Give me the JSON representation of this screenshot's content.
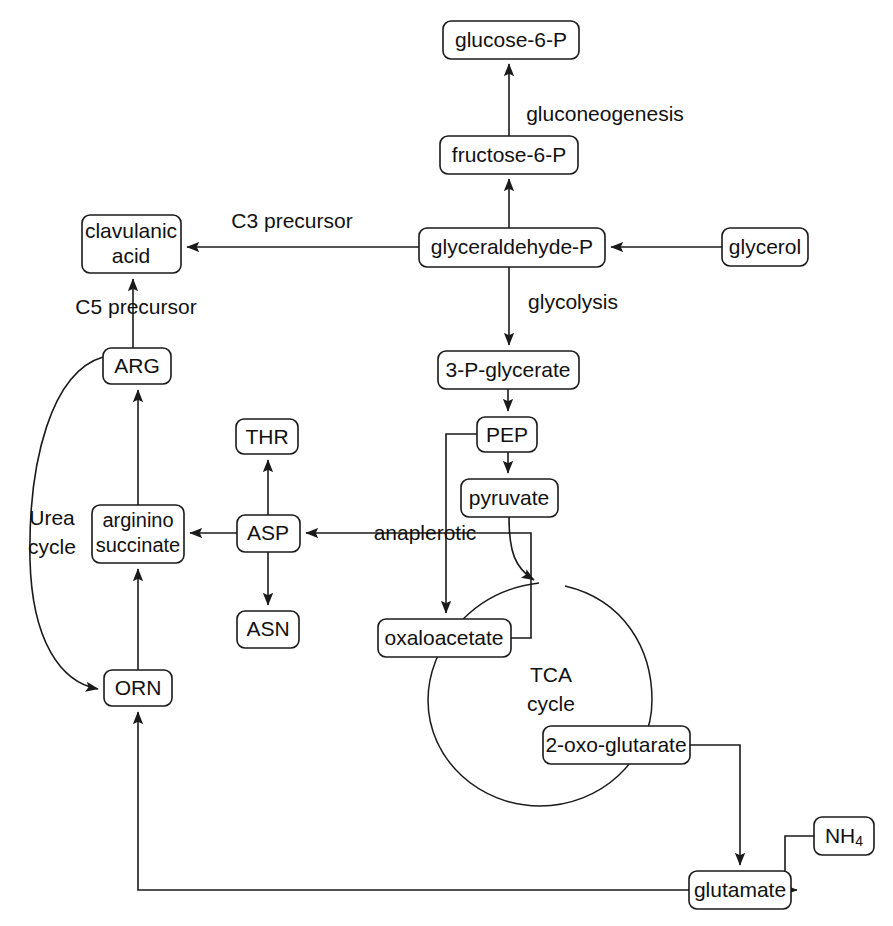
{
  "diagram": {
    "type": "pathway-flowchart",
    "canvas": {
      "width": 893,
      "height": 926
    },
    "background_color": "#ffffff",
    "line_color": "#1a1a1a",
    "text_color": "#111111"
  },
  "nodes": [
    {
      "id": "glucose6p",
      "label": "glucose-6-P",
      "lines": [
        "glucose-6-P"
      ],
      "x": 443,
      "y": 21,
      "w": 136,
      "h": 38
    },
    {
      "id": "fructose6p",
      "label": "fructose-6-P",
      "lines": [
        "fructose-6-P"
      ],
      "x": 440,
      "y": 136,
      "w": 138,
      "h": 38
    },
    {
      "id": "glyceraldehydep",
      "label": "glyceraldehyde-P",
      "lines": [
        "glyceraldehyde-P"
      ],
      "x": 419,
      "y": 228,
      "w": 186,
      "h": 39
    },
    {
      "id": "glycerol",
      "label": "glycerol",
      "lines": [
        "glycerol"
      ],
      "x": 722,
      "y": 228,
      "w": 86,
      "h": 38
    },
    {
      "id": "clavulanicacid",
      "label": "clavulanic acid",
      "lines": [
        "clavulanic",
        "acid"
      ],
      "x": 82,
      "y": 215,
      "w": 99,
      "h": 58
    },
    {
      "id": "glycerate3p",
      "label": "3-P-glycerate",
      "lines": [
        "3-P-glycerate"
      ],
      "x": 438,
      "y": 351,
      "w": 141,
      "h": 38
    },
    {
      "id": "pep",
      "label": "PEP",
      "lines": [
        "PEP"
      ],
      "x": 477,
      "y": 417,
      "w": 60,
      "h": 35
    },
    {
      "id": "pyruvate",
      "label": "pyruvate",
      "lines": [
        "pyruvate"
      ],
      "x": 461,
      "y": 479,
      "w": 97,
      "h": 38
    },
    {
      "id": "arg",
      "label": "ARG",
      "lines": [
        "ARG"
      ],
      "x": 103,
      "y": 348,
      "w": 68,
      "h": 36
    },
    {
      "id": "argininosuccinate",
      "label": "arginino succinate",
      "lines": [
        "arginino",
        "succinate"
      ],
      "x": 92,
      "y": 505,
      "w": 92,
      "h": 58
    },
    {
      "id": "orn",
      "label": "ORN",
      "lines": [
        "ORN"
      ],
      "x": 104,
      "y": 670,
      "w": 68,
      "h": 36
    },
    {
      "id": "thr",
      "label": "THR",
      "lines": [
        "THR"
      ],
      "x": 236,
      "y": 419,
      "w": 62,
      "h": 35
    },
    {
      "id": "asp",
      "label": "ASP",
      "lines": [
        "ASP"
      ],
      "x": 237,
      "y": 515,
      "w": 63,
      "h": 37
    },
    {
      "id": "asn",
      "label": "ASN",
      "lines": [
        "ASN"
      ],
      "x": 237,
      "y": 611,
      "w": 62,
      "h": 37
    },
    {
      "id": "oxaloacetate",
      "label": "oxaloacetate",
      "lines": [
        "oxaloacetate"
      ],
      "x": 378,
      "y": 619,
      "w": 133,
      "h": 38
    },
    {
      "id": "oxoglutarate",
      "label": "2-oxo-glutarate",
      "lines": [
        "2-oxo-glutarate"
      ],
      "x": 543,
      "y": 726,
      "w": 147,
      "h": 38
    },
    {
      "id": "glutamate",
      "label": "glutamate",
      "lines": [
        "glutamate"
      ],
      "x": 689,
      "y": 871,
      "w": 102,
      "h": 38
    },
    {
      "id": "nh4",
      "label": "NH4",
      "lines": [
        "NH4"
      ],
      "x": 814,
      "y": 817,
      "w": 60,
      "h": 38,
      "subscript": "4",
      "base": "NH"
    }
  ],
  "edge_labels": [
    {
      "id": "gluconeogenesis",
      "text": "gluconeogenesis",
      "x": 605,
      "y": 115
    },
    {
      "id": "c3precursor",
      "text": "C3 precursor",
      "x": 292,
      "y": 222
    },
    {
      "id": "glycolysis",
      "text": "glycolysis",
      "x": 573,
      "y": 303
    },
    {
      "id": "c5precursor",
      "text": "C5 precursor",
      "x": 136,
      "y": 308
    },
    {
      "id": "anaplerotic",
      "text": "anaplerotic",
      "x": 425,
      "y": 534
    },
    {
      "id": "ureacycle_1",
      "text": "Urea",
      "x": 52,
      "y": 519
    },
    {
      "id": "ureacycle_2",
      "text": "cycle",
      "x": 52,
      "y": 548
    },
    {
      "id": "tcacycle_1",
      "text": "TCA",
      "x": 551,
      "y": 676
    },
    {
      "id": "tcacycle_2",
      "text": "cycle",
      "x": 551,
      "y": 705
    }
  ],
  "edges": [
    {
      "id": "fructose6p-to-glucose6p",
      "from": "fructose-6-P",
      "to": "glucose-6-P",
      "label": "gluconeogenesis",
      "arrow": true
    },
    {
      "id": "glyceraldehydep-to-fructose6p",
      "from": "glyceraldehyde-P",
      "to": "fructose-6-P",
      "label": "",
      "arrow": true
    },
    {
      "id": "glycerol-to-glyceraldehydep",
      "from": "glycerol",
      "to": "glyceraldehyde-P",
      "label": "",
      "arrow": true
    },
    {
      "id": "glyceraldehydep-to-clavulanic",
      "from": "glyceraldehyde-P",
      "to": "clavulanic acid",
      "label": "C3 precursor",
      "arrow": true
    },
    {
      "id": "glyceraldehydep-to-glycerate3p",
      "from": "glyceraldehyde-P",
      "to": "3-P-glycerate",
      "label": "glycolysis",
      "arrow": true
    },
    {
      "id": "arg-to-clavulanic",
      "from": "ARG",
      "to": "clavulanic acid",
      "label": "C5 precursor",
      "arrow": true
    },
    {
      "id": "glycerate3p-to-pep",
      "from": "3-P-glycerate",
      "to": "PEP",
      "label": "",
      "arrow": true
    },
    {
      "id": "pep-to-pyruvate",
      "from": "PEP",
      "to": "pyruvate",
      "label": "",
      "arrow": true
    },
    {
      "id": "pep-to-oxaloacetate",
      "from": "PEP",
      "to": "oxaloacetate",
      "label": "anaplerotic",
      "arrow": true
    },
    {
      "id": "pyruvate-to-tca",
      "from": "pyruvate",
      "to": "TCA cycle",
      "label": "",
      "arrow": true
    },
    {
      "id": "oxaloacetate-to-asp",
      "from": "oxaloacetate",
      "to": "ASP",
      "label": "",
      "arrow": true
    },
    {
      "id": "asp-to-thr",
      "from": "ASP",
      "to": "THR",
      "label": "",
      "arrow": true
    },
    {
      "id": "asp-to-asn",
      "from": "ASP",
      "to": "ASN",
      "label": "",
      "arrow": true
    },
    {
      "id": "asp-to-argininosuccinate",
      "from": "ASP",
      "to": "arginino succinate",
      "label": "",
      "arrow": true
    },
    {
      "id": "argininosuccinate-to-arg",
      "from": "arginino succinate",
      "to": "ARG",
      "label": "",
      "arrow": true
    },
    {
      "id": "orn-to-argininosuccinate",
      "from": "ORN",
      "to": "arginino succinate",
      "label": "",
      "arrow": true
    },
    {
      "id": "arg-to-orn",
      "from": "ARG",
      "to": "ORN",
      "label": "Urea cycle",
      "arrow": true
    },
    {
      "id": "oxoglutarate-to-glutamate",
      "from": "2-oxo-glutarate",
      "to": "glutamate",
      "label": "",
      "arrow": true
    },
    {
      "id": "nh4-to-glutamate",
      "from": "NH4",
      "to": "glutamate",
      "label": "",
      "arrow": true
    },
    {
      "id": "glutamate-to-orn",
      "from": "glutamate",
      "to": "ORN",
      "label": "",
      "arrow": true
    }
  ]
}
